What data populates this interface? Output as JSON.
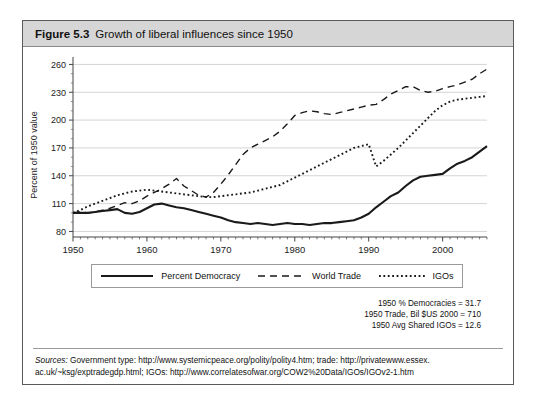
{
  "figure": {
    "number": "Figure 5.3",
    "title": "Growth of liberal influences since 1950"
  },
  "notes": [
    "1950 % Democracies = 31.7",
    "1950 Trade, Bil $US 2000 = 710",
    "1950 Avg Shared IGOs = 12.6"
  ],
  "sources": {
    "label": "Sources:",
    "line1": " Government type: http://www.systemicpeace.org/polity/polity4.htm; trade: http://privatewww.essex.",
    "line2": "ac.uk/~ksg/exptradegdp.html; IGOs: http://www.correlatesofwar.org/COW2%20Data/IGOs/IGOv2-1.htm"
  },
  "legend": {
    "items": [
      {
        "label": "Percent Democracy",
        "style": "solid",
        "color": "#1a1a1a"
      },
      {
        "label": "World Trade",
        "style": "dashed",
        "color": "#1a1a1a"
      },
      {
        "label": "IGOs",
        "style": "dotted",
        "color": "#1a1a1a"
      }
    ]
  },
  "chart_data": {
    "type": "line",
    "title": "Growth of liberal influences since 1950",
    "xlabel": "",
    "ylabel": "Percent of 1950 value",
    "xlim": [
      1950,
      2006
    ],
    "ylim": [
      74,
      268
    ],
    "yticks": [
      80,
      110,
      140,
      170,
      200,
      230,
      260
    ],
    "xticks": [
      1950,
      1960,
      1970,
      1980,
      1990,
      2000
    ],
    "grid": "horizontal-major",
    "legend_position": "below",
    "minor_ticks": "yearly",
    "x": [
      1950,
      1951,
      1952,
      1953,
      1954,
      1955,
      1956,
      1957,
      1958,
      1959,
      1960,
      1961,
      1962,
      1963,
      1964,
      1965,
      1966,
      1967,
      1968,
      1969,
      1970,
      1971,
      1972,
      1973,
      1974,
      1975,
      1976,
      1977,
      1978,
      1979,
      1980,
      1981,
      1982,
      1983,
      1984,
      1985,
      1986,
      1987,
      1988,
      1989,
      1990,
      1991,
      1992,
      1993,
      1994,
      1995,
      1996,
      1997,
      1998,
      1999,
      2000,
      2001,
      2002,
      2003,
      2004,
      2005,
      2006
    ],
    "series": [
      {
        "name": "Percent Democracy",
        "style": "solid",
        "color": "#1a1a1a",
        "values": [
          100,
          100,
          100,
          101,
          102,
          103,
          104,
          100,
          99,
          101,
          105,
          109,
          110,
          108,
          106,
          105,
          103,
          101,
          99,
          97,
          95,
          92,
          90,
          89,
          88,
          89,
          88,
          87,
          88,
          89,
          88,
          88,
          87,
          88,
          89,
          89,
          90,
          91,
          92,
          95,
          99,
          106,
          112,
          118,
          122,
          129,
          135,
          139,
          140,
          141,
          142,
          148,
          153,
          156,
          160,
          166,
          172
        ]
      },
      {
        "name": "World Trade",
        "style": "dashed",
        "color": "#1a1a1a",
        "values": [
          100,
          101,
          100,
          101,
          103,
          105,
          108,
          111,
          110,
          113,
          118,
          122,
          126,
          131,
          137,
          129,
          124,
          119,
          117,
          122,
          131,
          141,
          152,
          163,
          170,
          174,
          178,
          182,
          188,
          196,
          205,
          208,
          210,
          209,
          207,
          206,
          208,
          210,
          212,
          214,
          216,
          217,
          222,
          228,
          232,
          236,
          236,
          232,
          230,
          231,
          234,
          236,
          238,
          241,
          244,
          250,
          255
        ]
      },
      {
        "name": "IGOs",
        "style": "dotted",
        "color": "#1a1a1a",
        "values": [
          100,
          103,
          107,
          110,
          113,
          116,
          119,
          121,
          123,
          124,
          125,
          124,
          123,
          122,
          121,
          120,
          119,
          118,
          117,
          117,
          118,
          119,
          120,
          121,
          122,
          124,
          126,
          128,
          130,
          134,
          138,
          142,
          146,
          150,
          154,
          158,
          162,
          166,
          170,
          172,
          174,
          150,
          156,
          163,
          170,
          178,
          186,
          194,
          202,
          210,
          216,
          220,
          222,
          223,
          224,
          225,
          226
        ]
      }
    ]
  }
}
